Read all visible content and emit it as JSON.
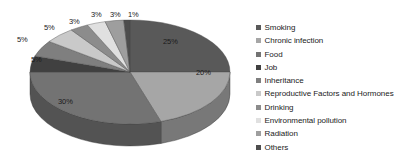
{
  "chart_data": {
    "type": "pie",
    "title": "",
    "subtitle": "",
    "xlabel": "",
    "ylabel": "",
    "three_d": true,
    "grid": false,
    "legend_position": "right",
    "value_unit": "%",
    "categories": [
      "Smoking",
      "Chronic infection",
      "Food",
      "Job",
      "Inheritance",
      "Reproductive Factors and Hormones",
      "Drinking",
      "Environmental pollution",
      "Radiation",
      "Others"
    ],
    "values": [
      25,
      20,
      30,
      5,
      5,
      5,
      3,
      3,
      3,
      1
    ],
    "data_labels": [
      "25%",
      "20%",
      "30%",
      "5%",
      "5%",
      "5%",
      "3%",
      "3%",
      "3%",
      "1%"
    ],
    "colors": [
      "#595959",
      "#a6a6a6",
      "#737373",
      "#404040",
      "#7f7f7f",
      "#c9c9c9",
      "#8c8c8c",
      "#e0e0e0",
      "#9e9e9e",
      "#4d4d4d"
    ],
    "side_colors": [
      "#3f3f3f",
      "#787878",
      "#535353",
      "#2d2d2d",
      "#5b5b5b",
      "#919191",
      "#656565",
      "#a2a2a2",
      "#727272",
      "#373737"
    ]
  },
  "legend": {
    "items": [
      {
        "label": "Smoking",
        "color": "#595959"
      },
      {
        "label": "Chronic infection",
        "color": "#a6a6a6"
      },
      {
        "label": "Food",
        "color": "#737373"
      },
      {
        "label": "Job",
        "color": "#404040"
      },
      {
        "label": "Inheritance",
        "color": "#7f7f7f"
      },
      {
        "label": "Reproductive Factors and Hormones",
        "color": "#c9c9c9"
      },
      {
        "label": "Drinking",
        "color": "#8c8c8c"
      },
      {
        "label": "Environmental pollution",
        "color": "#e0e0e0"
      },
      {
        "label": "Radiation",
        "color": "#9e9e9e"
      },
      {
        "label": "Others",
        "color": "#4d4d4d"
      }
    ]
  },
  "slice_labels": [
    {
      "text": "25%",
      "x": 163,
      "y": 37
    },
    {
      "text": "20%",
      "x": 196,
      "y": 68
    },
    {
      "text": "30%",
      "x": 58,
      "y": 97
    },
    {
      "text": "5%",
      "x": 31,
      "y": 55
    },
    {
      "text": "5%",
      "x": 17,
      "y": 35
    },
    {
      "text": "5%",
      "x": 44,
      "y": 23
    },
    {
      "text": "3%",
      "x": 69,
      "y": 17
    },
    {
      "text": "3%",
      "x": 91,
      "y": 10
    },
    {
      "text": "3%",
      "x": 110,
      "y": 10
    },
    {
      "text": "1%",
      "x": 128,
      "y": 10
    }
  ]
}
